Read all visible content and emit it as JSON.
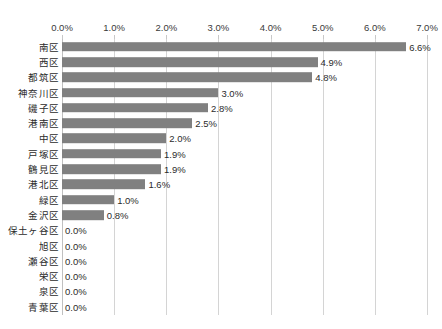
{
  "chart_data": {
    "type": "bar",
    "orientation": "horizontal",
    "title": "",
    "xlabel": "",
    "ylabel": "",
    "xlim": [
      0,
      7
    ],
    "xtick_labels": [
      "0.0%",
      "1.0%",
      "2.0%",
      "3.0%",
      "4.0%",
      "5.0%",
      "6.0%",
      "7.0%"
    ],
    "xtick_values": [
      0,
      1,
      2,
      3,
      4,
      5,
      6,
      7
    ],
    "grid": true,
    "legend": false,
    "categories": [
      "南区",
      "西区",
      "都筑区",
      "神奈川区",
      "磯子区",
      "港南区",
      "中区",
      "戸塚区",
      "鶴見区",
      "港北区",
      "緑区",
      "金沢区",
      "保土ヶ谷区",
      "旭区",
      "瀬谷区",
      "栄区",
      "泉区",
      "青葉区"
    ],
    "values": [
      6.6,
      4.9,
      4.8,
      3.0,
      2.8,
      2.5,
      2.0,
      1.9,
      1.9,
      1.6,
      1.0,
      0.8,
      0.0,
      0.0,
      0.0,
      0.0,
      0.0,
      0.0
    ],
    "data_labels": [
      "6.6%",
      "4.9%",
      "4.8%",
      "3.0%",
      "2.8%",
      "2.5%",
      "2.0%",
      "1.9%",
      "1.9%",
      "1.6%",
      "1.0%",
      "0.8%",
      "0.0%",
      "0.0%",
      "0.0%",
      "0.0%",
      "0.0%",
      "0.0%"
    ],
    "bar_color": "#808080",
    "gridline_color": "#d4d4d4",
    "text_color": "#2b2b2b"
  }
}
